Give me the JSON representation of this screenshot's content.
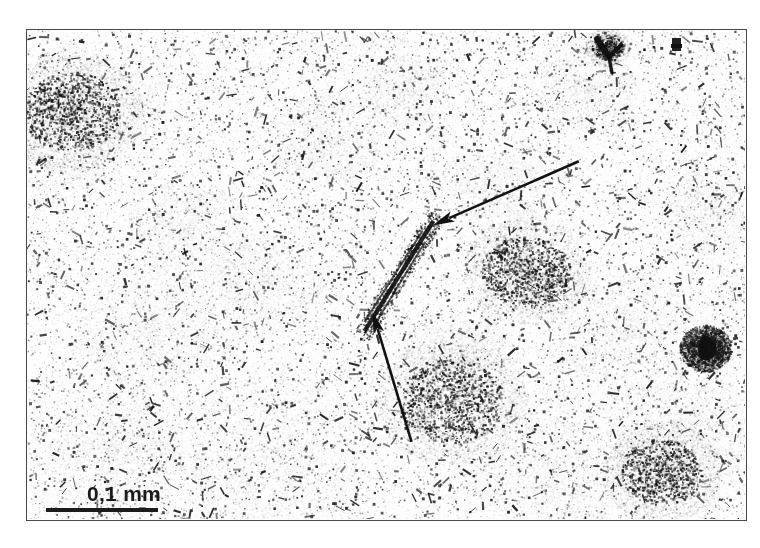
{
  "figure": {
    "type": "optical-micrograph",
    "title": "",
    "caption": "",
    "background_color": "#ffffff",
    "frame": {
      "border_color": "#4a4a4a",
      "border_width_px": 1.5,
      "x": 26,
      "y": 29,
      "width": 721,
      "height": 492
    }
  },
  "scale_bar": {
    "label": "0,1 mm",
    "value": 0.1,
    "unit": "mm",
    "bar_color": "#1b1b1b",
    "bar_length_px": 112,
    "text_color": "#1b1b1b"
  },
  "annotations": {
    "color": "#121212",
    "arrows": [
      {
        "name": "arrow-upper-right",
        "description": "arrow pointing down-left to elongated dark fibre",
        "tail_x": 577,
        "tail_y": 160,
        "tip_x": 431,
        "tip_y": 224,
        "line_width": 2.6,
        "head_length": 22,
        "head_width": 11
      },
      {
        "name": "arrow-lower",
        "description": "arrow pointing up-left to lower end of elongated dark fibre",
        "tail_x": 410,
        "tail_y": 440,
        "tip_x": 371,
        "tip_y": 310,
        "line_width": 2.6,
        "head_length": 22,
        "head_width": 11
      }
    ]
  },
  "specimen": {
    "description": "grainy thin-section micrograph, dark speckle inclusions on pale matrix",
    "speckle_color": "#1c1c1c",
    "cloud_color": "#8f8f8f",
    "matrix_color": "#fdfdfd",
    "features": [
      {
        "name": "elongated-fibre",
        "cx": 398,
        "cy": 275,
        "length": 130,
        "angle_deg": -58
      },
      {
        "name": "dark-blob-right",
        "cx": 704,
        "cy": 347,
        "size": 32
      },
      {
        "name": "y-shaped-grain-top",
        "cx": 606,
        "cy": 46,
        "size": 28
      },
      {
        "name": "cluster-upper-left",
        "cx": 70,
        "cy": 110,
        "size": 90
      },
      {
        "name": "cluster-mid-right",
        "cx": 525,
        "cy": 270,
        "size": 80
      },
      {
        "name": "cluster-lower-centre",
        "cx": 450,
        "cy": 400,
        "size": 95
      },
      {
        "name": "cluster-lower-right",
        "cx": 660,
        "cy": 470,
        "size": 75
      }
    ]
  }
}
